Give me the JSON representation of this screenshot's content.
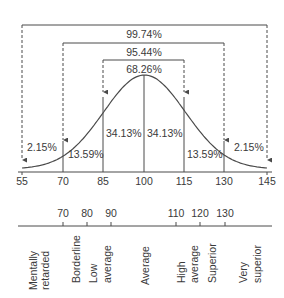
{
  "chart_data": {
    "type": "area",
    "title": "",
    "xlabel": "",
    "ylabel": "",
    "xlim": [
      55,
      145
    ],
    "x_ticks": [
      55,
      70,
      85,
      100,
      115,
      130,
      145
    ],
    "x_tick_labels": [
      "55",
      "70",
      "85",
      "100",
      "115",
      "130",
      "145"
    ],
    "mean": 100,
    "sd": 15,
    "bands": [
      {
        "from": 55,
        "to": 70,
        "percent": 2.15,
        "label": "2.15%"
      },
      {
        "from": 70,
        "to": 85,
        "percent": 13.59,
        "label": "13.59%"
      },
      {
        "from": 85,
        "to": 100,
        "percent": 34.13,
        "label": "34.13%"
      },
      {
        "from": 100,
        "to": 115,
        "percent": 34.13,
        "label": "34.13%"
      },
      {
        "from": 115,
        "to": 130,
        "percent": 13.59,
        "label": "13.59%"
      },
      {
        "from": 130,
        "to": 145,
        "percent": 2.15,
        "label": "2.15%"
      }
    ],
    "ranges": [
      {
        "from": 85,
        "to": 115,
        "label": "68.26%"
      },
      {
        "from": 70,
        "to": 130,
        "label": "95.44%"
      },
      {
        "from": 55,
        "to": 145,
        "label": "99.74%"
      }
    ],
    "grid": false,
    "legend": null,
    "classification_scale": {
      "ticks": [
        70,
        80,
        90,
        110,
        120,
        130
      ],
      "tick_labels": [
        "70",
        "80",
        "90",
        "110",
        "120",
        "130"
      ],
      "categories": [
        {
          "lines": [
            "Mentally",
            "retarded"
          ],
          "range": "< 70"
        },
        {
          "lines": [
            "Borderline"
          ],
          "range": "70-79"
        },
        {
          "lines": [
            "Low",
            "average"
          ],
          "range": "80-89"
        },
        {
          "lines": [
            "Average"
          ],
          "range": "90-109"
        },
        {
          "lines": [
            "High",
            "average"
          ],
          "range": "110-119"
        },
        {
          "lines": [
            "Superior"
          ],
          "range": "120-129"
        },
        {
          "lines": [
            "Very",
            "superior"
          ],
          "range": "130+"
        }
      ]
    }
  },
  "labels": {
    "range_99": "99.74%",
    "range_95": "95.44%",
    "range_68": "68.26%",
    "band_55_70": "2.15%",
    "band_70_85": "13.59%",
    "band_85_100": "34.13%",
    "band_100_115": "34.13%",
    "band_115_130": "13.59%",
    "band_130_145": "2.15%",
    "axis": [
      "55",
      "70",
      "85",
      "100",
      "115",
      "130",
      "145"
    ],
    "scale_ticks": [
      "70",
      "80",
      "90",
      "110",
      "120",
      "130"
    ],
    "cat_mentally": "Mentally",
    "cat_retarded": "retarded",
    "cat_borderline": "Borderline",
    "cat_low": "Low",
    "cat_low_average": "average",
    "cat_average": "Average",
    "cat_high": "High",
    "cat_high_average": "average",
    "cat_superior": "Superior",
    "cat_very": "Very",
    "cat_very_superior": "superior"
  },
  "colors": {
    "line": "#4a4a4a",
    "text": "#3a3a3a",
    "background": "#ffffff"
  }
}
